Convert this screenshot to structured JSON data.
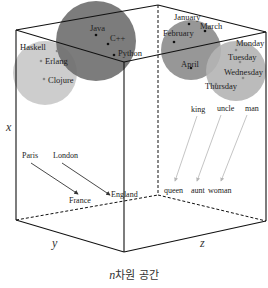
{
  "diagram": {
    "title": "n차원 공간",
    "caption_var": "n",
    "caption_rest": "차원 공간",
    "axes": {
      "x": {
        "label": "x",
        "pos": [
          6,
          131
        ]
      },
      "y": {
        "label": "y",
        "pos": [
          52,
          247
        ]
      },
      "z": {
        "label": "z",
        "pos": [
          200,
          247
        ]
      }
    },
    "colors": {
      "edge": "#111111",
      "cluster_light": "#c8c8c8",
      "cluster_dark": "#6e6e6e",
      "cluster_mid": "#8c8c8c",
      "arrow_dark": "#333333",
      "arrow_light": "#b5b5b5"
    },
    "clusters": [
      {
        "name": "functional-languages",
        "circle": {
          "cx": 45,
          "cy": 73,
          "r": 32,
          "fill": "#c8c8c8"
        },
        "points": [
          {
            "label": "Haskell",
            "x": 57,
            "y": 51,
            "lx": 20,
            "ly": 50
          },
          {
            "label": "Erlang",
            "x": 41,
            "y": 61,
            "lx": 45,
            "ly": 64
          },
          {
            "label": "Clojure",
            "x": 44,
            "y": 79,
            "lx": 48,
            "ly": 83
          }
        ]
      },
      {
        "name": "oop-languages",
        "circle": {
          "cx": 96,
          "cy": 41,
          "r": 40,
          "fill": "#6e6e6e"
        },
        "points": [
          {
            "label": "Java",
            "x": 96,
            "y": 35,
            "lx": 90,
            "ly": 31
          },
          {
            "label": "C++",
            "x": 108,
            "y": 44,
            "lx": 110,
            "ly": 41
          },
          {
            "label": "Python",
            "x": 114,
            "y": 55,
            "lx": 118,
            "ly": 56
          }
        ]
      },
      {
        "name": "months",
        "circle": {
          "cx": 191,
          "cy": 50,
          "r": 30,
          "fill": "#8c8c8c"
        },
        "points": [
          {
            "label": "January",
            "x": 189,
            "y": 24,
            "lx": 174,
            "ly": 20
          },
          {
            "label": "March",
            "x": 205,
            "y": 31,
            "lx": 200,
            "ly": 29
          },
          {
            "label": "February",
            "x": 174,
            "y": 42,
            "lx": 163,
            "ly": 36
          },
          {
            "label": "April",
            "x": 191,
            "y": 68,
            "lx": 181,
            "ly": 67
          }
        ]
      },
      {
        "name": "weekdays",
        "circle": {
          "cx": 236,
          "cy": 71,
          "r": 30,
          "fill": "#b4b4b4"
        },
        "points": [
          {
            "label": "Monday",
            "x": 236,
            "y": 50,
            "lx": 236,
            "ly": 46
          },
          {
            "label": "Tuesday",
            "x": 240,
            "y": 62,
            "lx": 228,
            "ly": 60
          },
          {
            "label": "Wednesday",
            "x": 243,
            "y": 78,
            "lx": 224,
            "ly": 75
          },
          {
            "label": "Thursday",
            "x": 216,
            "y": 84,
            "lx": 205,
            "ly": 89
          }
        ]
      }
    ],
    "relations": [
      {
        "from": {
          "label": "Paris",
          "lx": 22,
          "ly": 158,
          "x": 31,
          "y": 163
        },
        "to": {
          "label": "France",
          "lx": 69,
          "ly": 203,
          "x": 78,
          "y": 194
        },
        "style": "dark"
      },
      {
        "from": {
          "label": "London",
          "lx": 53,
          "ly": 158,
          "x": 62,
          "y": 163
        },
        "to": {
          "label": "England",
          "lx": 111,
          "ly": 197,
          "x": 110,
          "y": 195
        },
        "style": "dark"
      },
      {
        "from": {
          "label": "king",
          "lx": 191,
          "ly": 112,
          "x": 197,
          "y": 116
        },
        "to": {
          "label": "queen",
          "lx": 164,
          "ly": 193,
          "x": 175,
          "y": 181
        },
        "style": "light"
      },
      {
        "from": {
          "label": "uncle",
          "lx": 217,
          "ly": 111,
          "x": 221,
          "y": 115
        },
        "to": {
          "label": "aunt",
          "lx": 191,
          "ly": 193,
          "x": 197,
          "y": 181
        },
        "style": "light"
      },
      {
        "from": {
          "label": "man",
          "lx": 245,
          "ly": 111,
          "x": 247,
          "y": 115
        },
        "to": {
          "label": "woman",
          "lx": 208,
          "ly": 193,
          "x": 221,
          "y": 181
        },
        "style": "light"
      }
    ],
    "cube": {
      "solid": [
        [
          16,
          30,
          158,
          5
        ],
        [
          158,
          5,
          266,
          32
        ],
        [
          266,
          32,
          124,
          62
        ],
        [
          124,
          62,
          16,
          30
        ],
        [
          16,
          30,
          16,
          220
        ],
        [
          124,
          62,
          124,
          252
        ],
        [
          266,
          32,
          266,
          221
        ],
        [
          16,
          220,
          124,
          252
        ],
        [
          124,
          252,
          266,
          221
        ]
      ],
      "dashed": [
        [
          158,
          5,
          158,
          195
        ],
        [
          16,
          220,
          158,
          195
        ],
        [
          158,
          195,
          266,
          221
        ]
      ]
    }
  }
}
